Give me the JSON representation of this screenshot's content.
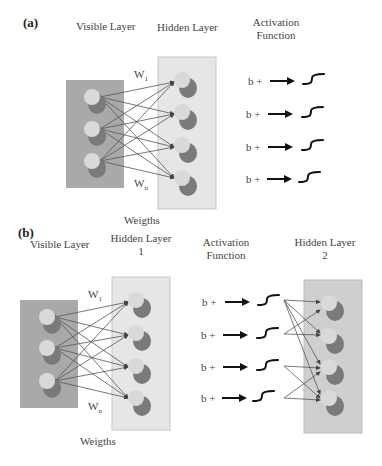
{
  "panel_a": {
    "tag": "(a)",
    "labels": {
      "visible": "Visible Layer",
      "hidden": "Hidden Layer",
      "activation_1": "Activation",
      "activation_2": "Function",
      "w1": "W",
      "w1_sub": "1",
      "wn": "W",
      "wn_sub": "n",
      "weights": "Weigths"
    },
    "visible_nodes": 3,
    "hidden_nodes": 4,
    "activation_rows": [
      "b +",
      "b +",
      "b +",
      "b +"
    ]
  },
  "panel_b": {
    "tag": "(b)",
    "labels": {
      "visible": "Visible Layer",
      "hidden1_1": "Hidden Layer",
      "hidden1_2": "1",
      "activation_1": "Activation",
      "activation_2": "Function",
      "hidden2_1": "Hidden Layer",
      "hidden2_2": "2",
      "w1": "W",
      "w1_sub": "1",
      "wn": "W",
      "wn_sub": "n",
      "weights": "Weigths"
    },
    "visible_nodes": 3,
    "hidden1_nodes": 4,
    "hidden2_nodes": 4,
    "activation_rows": [
      "b +",
      "b +",
      "b +",
      "b +"
    ]
  },
  "colors": {
    "visible_box": "#a9a9a9",
    "hidden_box": "#e6e6e6",
    "hidden2_box": "#cfcfcf",
    "node_fill": "#d9d9d9",
    "node_shadow": "#7a7a7a",
    "edge": "#555555"
  }
}
